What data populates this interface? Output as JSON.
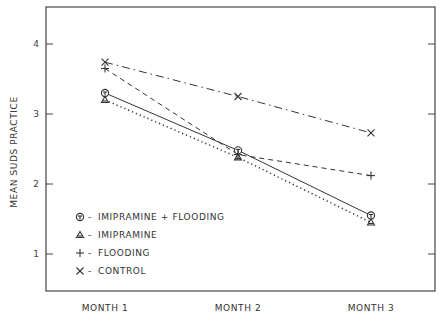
{
  "chart_data": {
    "type": "line",
    "title": "",
    "xlabel": "",
    "ylabel": "MEAN SUDS PRACTICE",
    "categories": [
      "MONTH 1",
      "MONTH 2",
      "MONTH 3"
    ],
    "yticks": [
      1,
      2,
      3,
      4
    ],
    "ylim": [
      0.5,
      4.5
    ],
    "grid": false,
    "legend_position": "lower-left inside",
    "series": [
      {
        "name": "IMIPRAMINE + FLOODING",
        "marker": "circle-bar",
        "marker_glyph": "⊖",
        "line_style": "solid",
        "values": [
          3.3,
          2.48,
          1.55
        ]
      },
      {
        "name": "IMIPRAMINE",
        "marker": "triangle",
        "marker_glyph": "△",
        "line_style": "dotted",
        "values": [
          3.2,
          2.38,
          1.45
        ]
      },
      {
        "name": "FLOODING",
        "marker": "plus",
        "marker_glyph": "+",
        "line_style": "dashed",
        "values": [
          3.65,
          2.42,
          2.12
        ]
      },
      {
        "name": "CONTROL",
        "marker": "x",
        "marker_glyph": "×",
        "line_style": "dash-dot",
        "values": [
          3.74,
          3.25,
          2.73
        ]
      }
    ]
  },
  "legend": {
    "items": [
      {
        "symbol": "Φ",
        "label": "IMIPRAMINE + FLOODING"
      },
      {
        "symbol": "▲",
        "label": "IMIPRAMINE"
      },
      {
        "symbol": "+",
        "label": "FLOODING"
      },
      {
        "symbol": "×",
        "label": "CONTROL"
      }
    ],
    "separator": "-"
  },
  "colors": {
    "ink": "#333333",
    "background": "#ffffff"
  }
}
